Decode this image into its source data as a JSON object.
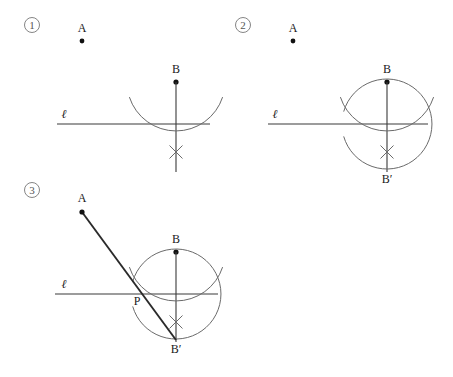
{
  "figure": {
    "background_color": "#ffffff",
    "ink_color": "#2a2a2a",
    "arc_color": "#6a6a6a",
    "width": 453,
    "height": 377
  },
  "panels": [
    {
      "id": "panel-1",
      "number_label": "1",
      "number_pos": {
        "x": 32,
        "y": 25
      },
      "labels": {
        "point_a": "A",
        "point_b": "B",
        "line_l": "ℓ"
      },
      "points": {
        "a": {
          "x": 82,
          "y": 41
        },
        "b": {
          "x": 176,
          "y": 82
        },
        "foot": {
          "x": 176,
          "y": 124
        },
        "xmark": {
          "x": 176,
          "y": 152
        }
      },
      "label_pos": {
        "a": {
          "x": 82,
          "y": 32
        },
        "b": {
          "x": 176,
          "y": 73
        },
        "l": {
          "x": 64,
          "y": 118
        }
      },
      "line_l_span": {
        "x1": 57,
        "x2": 210,
        "y": 124
      },
      "vertical_span": {
        "x": 176,
        "y1": 82,
        "y2": 172
      },
      "small_arc": {
        "cx": 176,
        "cy": 82,
        "r": 49,
        "start_deg": 198,
        "end_deg": 342
      },
      "has_big_arc": false,
      "has_bprime": false,
      "has_ab_line": false
    },
    {
      "id": "panel-2",
      "number_label": "2",
      "number_pos": {
        "x": 243,
        "y": 25
      },
      "labels": {
        "point_a": "A",
        "point_b": "B",
        "point_bprime": "B′",
        "line_l": "ℓ"
      },
      "points": {
        "a": {
          "x": 293,
          "y": 41
        },
        "b": {
          "x": 387,
          "y": 82
        },
        "foot": {
          "x": 387,
          "y": 124
        },
        "xmark": {
          "x": 387,
          "y": 152
        },
        "bprime": {
          "x": 387,
          "y": 167
        }
      },
      "label_pos": {
        "a": {
          "x": 293,
          "y": 32
        },
        "b": {
          "x": 387,
          "y": 73
        },
        "bprime": {
          "x": 387,
          "y": 183
        },
        "l": {
          "x": 275,
          "y": 118
        }
      },
      "line_l_span": {
        "x1": 268,
        "x2": 428,
        "y": 124
      },
      "vertical_span": {
        "x": 387,
        "y1": 82,
        "y2": 172
      },
      "small_arc": {
        "cx": 387,
        "cy": 82,
        "r": 49,
        "start_deg": 198,
        "end_deg": 342
      },
      "big_arc": {
        "cx": 387,
        "cy": 124,
        "r": 45,
        "start_deg": 196,
        "end_deg": 164
      },
      "has_big_arc": true,
      "has_bprime": true,
      "has_ab_line": false
    },
    {
      "id": "panel-3",
      "number_label": "3",
      "number_pos": {
        "x": 32,
        "y": 190
      },
      "labels": {
        "point_a": "A",
        "point_b": "B",
        "point_bprime": "B′",
        "point_p": "P",
        "line_l": "ℓ"
      },
      "points": {
        "a": {
          "x": 82,
          "y": 212
        },
        "b": {
          "x": 176,
          "y": 252
        },
        "foot": {
          "x": 176,
          "y": 294
        },
        "xmark": {
          "x": 176,
          "y": 322
        },
        "bprime": {
          "x": 176,
          "y": 337
        },
        "p": {
          "x": 141,
          "y": 294
        }
      },
      "label_pos": {
        "a": {
          "x": 82,
          "y": 202
        },
        "b": {
          "x": 176,
          "y": 243
        },
        "bprime": {
          "x": 176,
          "y": 353
        },
        "p": {
          "x": 137,
          "y": 305
        },
        "l": {
          "x": 64,
          "y": 288
        }
      },
      "line_l_span": {
        "x1": 55,
        "x2": 218,
        "y": 294
      },
      "vertical_span": {
        "x": 176,
        "y1": 252,
        "y2": 342
      },
      "small_arc": {
        "cx": 176,
        "cy": 252,
        "r": 49,
        "start_deg": 198,
        "end_deg": 342
      },
      "big_arc": {
        "cx": 176,
        "cy": 294,
        "r": 45,
        "start_deg": 196,
        "end_deg": 164
      },
      "ab_line": {
        "x1": 82,
        "y1": 212,
        "x2": 176,
        "y2": 340
      },
      "has_big_arc": true,
      "has_bprime": true,
      "has_ab_line": true
    }
  ]
}
